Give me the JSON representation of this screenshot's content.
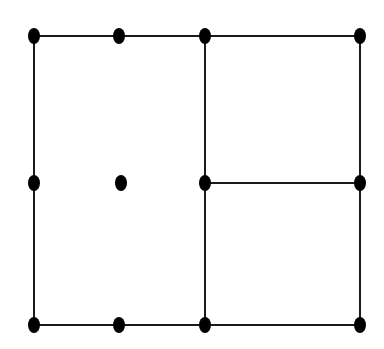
{
  "diagram": {
    "width": 384,
    "height": 349,
    "background": "#ffffff",
    "stroke_color": "#1a1a1a",
    "node_color": "#000000",
    "stroke_width": 2,
    "node_rx": 6,
    "node_ry": 8,
    "nodes": [
      {
        "id": "n1",
        "x": 34,
        "y": 36
      },
      {
        "id": "n2",
        "x": 119,
        "y": 36
      },
      {
        "id": "n3",
        "x": 205,
        "y": 36
      },
      {
        "id": "n4",
        "x": 360,
        "y": 36
      },
      {
        "id": "n5",
        "x": 34,
        "y": 183
      },
      {
        "id": "n6",
        "x": 121,
        "y": 183
      },
      {
        "id": "n7",
        "x": 205,
        "y": 183
      },
      {
        "id": "n8",
        "x": 360,
        "y": 183
      },
      {
        "id": "n9",
        "x": 34,
        "y": 325
      },
      {
        "id": "n10",
        "x": 119,
        "y": 325
      },
      {
        "id": "n11",
        "x": 205,
        "y": 325
      },
      {
        "id": "n12",
        "x": 360,
        "y": 325
      }
    ],
    "edges": [
      {
        "from": "n1",
        "to": "n4"
      },
      {
        "from": "n9",
        "to": "n12"
      },
      {
        "from": "n1",
        "to": "n9"
      },
      {
        "from": "n3",
        "to": "n11"
      },
      {
        "from": "n4",
        "to": "n12"
      },
      {
        "from": "n7",
        "to": "n8"
      }
    ]
  }
}
